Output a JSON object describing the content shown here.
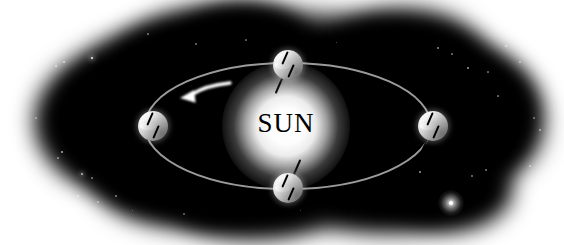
{
  "figure": {
    "title_text": "SUN",
    "kind": "astronomy-diagram",
    "background_color": "#ffffff",
    "space_color": "#000000",
    "sun_color": "#ffffff",
    "planet_color": "#f0f0f0",
    "orbit_color": "#9a9a9a",
    "arrow_color": "#ffffff",
    "label_color": "#000000"
  },
  "sun": {
    "label": "SUN",
    "center_x": 286,
    "center_y": 126,
    "radius": 40
  },
  "orbit": {
    "center_x": 288,
    "center_y": 126,
    "radius_x": 143,
    "radius_y": 63,
    "stroke_width": 2,
    "color": "#9a9a9a"
  },
  "direction_arrow": {
    "name": "orbital-direction-arrow",
    "meaning": "counterclockwise",
    "tip_x": 180,
    "tip_y": 98,
    "tail_x": 230,
    "tail_y": 83,
    "color": "#ffffff"
  },
  "planets": [
    {
      "name": "planet-top",
      "position": "top",
      "center_x": 288,
      "center_y": 65,
      "radius": 15,
      "axis_tilt_degrees": 23.5,
      "axis_length": 62
    },
    {
      "name": "planet-left",
      "position": "left",
      "center_x": 153,
      "center_y": 126,
      "radius": 15,
      "axis_tilt_degrees": 23.5,
      "axis_length": 62
    },
    {
      "name": "planet-bottom",
      "position": "bottom",
      "center_x": 288,
      "center_y": 188,
      "radius": 15,
      "axis_tilt_degrees": 23.5,
      "axis_length": 62
    },
    {
      "name": "planet-right",
      "position": "right",
      "center_x": 433,
      "center_y": 126,
      "radius": 15,
      "axis_tilt_degrees": 23.5,
      "axis_length": 62
    }
  ],
  "stars": [
    {
      "x": 92,
      "y": 58,
      "size": 2.4,
      "brightness": 0.95
    },
    {
      "x": 64,
      "y": 62,
      "size": 1.4,
      "brightness": 0.55
    },
    {
      "x": 56,
      "y": 66,
      "size": 1.2,
      "brightness": 0.45
    },
    {
      "x": 148,
      "y": 34,
      "size": 1.2,
      "brightness": 0.4
    },
    {
      "x": 196,
      "y": 44,
      "size": 1.1,
      "brightness": 0.38
    },
    {
      "x": 246,
      "y": 40,
      "size": 1.1,
      "brightness": 0.35
    },
    {
      "x": 336,
      "y": 42,
      "size": 1.0,
      "brightness": 0.33
    },
    {
      "x": 438,
      "y": 48,
      "size": 1.3,
      "brightness": 0.5
    },
    {
      "x": 452,
      "y": 54,
      "size": 1.1,
      "brightness": 0.4
    },
    {
      "x": 468,
      "y": 68,
      "size": 1.4,
      "brightness": 0.55
    },
    {
      "x": 488,
      "y": 72,
      "size": 1.1,
      "brightness": 0.38
    },
    {
      "x": 506,
      "y": 46,
      "size": 1.2,
      "brightness": 0.42
    },
    {
      "x": 520,
      "y": 62,
      "size": 1.1,
      "brightness": 0.36
    },
    {
      "x": 498,
      "y": 96,
      "size": 1.2,
      "brightness": 0.4
    },
    {
      "x": 62,
      "y": 152,
      "size": 1.6,
      "brightness": 0.6
    },
    {
      "x": 58,
      "y": 158,
      "size": 1.2,
      "brightness": 0.42
    },
    {
      "x": 82,
      "y": 174,
      "size": 2.0,
      "brightness": 0.7
    },
    {
      "x": 92,
      "y": 178,
      "size": 1.2,
      "brightness": 0.4
    },
    {
      "x": 78,
      "y": 196,
      "size": 1.4,
      "brightness": 0.48
    },
    {
      "x": 98,
      "y": 202,
      "size": 1.1,
      "brightness": 0.36
    },
    {
      "x": 116,
      "y": 196,
      "size": 1.3,
      "brightness": 0.45
    },
    {
      "x": 132,
      "y": 210,
      "size": 1.0,
      "brightness": 0.32
    },
    {
      "x": 184,
      "y": 214,
      "size": 1.1,
      "brightness": 0.34
    },
    {
      "x": 300,
      "y": 210,
      "size": 1.0,
      "brightness": 0.3
    },
    {
      "x": 420,
      "y": 172,
      "size": 1.5,
      "brightness": 0.55
    },
    {
      "x": 472,
      "y": 176,
      "size": 1.3,
      "brightness": 0.45
    },
    {
      "x": 486,
      "y": 170,
      "size": 1.2,
      "brightness": 0.4
    },
    {
      "x": 530,
      "y": 166,
      "size": 1.1,
      "brightness": 0.38
    },
    {
      "x": 540,
      "y": 130,
      "size": 1.3,
      "brightness": 0.46
    },
    {
      "x": 534,
      "y": 118,
      "size": 1.1,
      "brightness": 0.36
    },
    {
      "x": 36,
      "y": 118,
      "size": 1.1,
      "brightness": 0.32
    }
  ],
  "bright_star": {
    "name": "bright-star",
    "x": 451,
    "y": 203,
    "core_size": 4,
    "glow_size": 26
  }
}
